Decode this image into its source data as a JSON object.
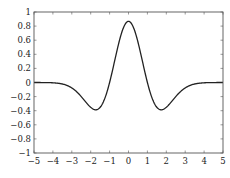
{
  "chart_data": {
    "type": "line",
    "title": "",
    "xlabel": "",
    "ylabel": "",
    "xlim": [
      -5,
      5
    ],
    "ylim": [
      -1,
      1
    ],
    "grid": false,
    "legend": null,
    "x_ticks": [
      -5,
      -4,
      -3,
      -2,
      -1,
      0,
      1,
      2,
      3,
      4,
      5
    ],
    "x_tick_labels": [
      "−5",
      "−4",
      "−3",
      "−2",
      "−1",
      "0",
      "1",
      "2",
      "3",
      "4",
      "5"
    ],
    "y_ticks": [
      -1,
      -0.8,
      -0.6,
      -0.4,
      -0.2,
      0,
      0.2,
      0.4,
      0.6,
      0.8,
      1
    ],
    "y_tick_labels": [
      "−1",
      "−0.8",
      "−0.6",
      "−0.4",
      "−0.2",
      "0",
      "0.2",
      "0.4",
      "0.6",
      "0.8",
      "1"
    ],
    "series": [
      {
        "name": "Mexican hat wavelet",
        "color": "#222222",
        "x": [
          -5,
          -4.5,
          -4,
          -3.5,
          -3,
          -2.5,
          -2,
          -1.73,
          -1.5,
          -1,
          -0.5,
          0,
          0.5,
          1,
          1.5,
          1.73,
          2,
          2.5,
          3,
          3.5,
          4,
          4.5,
          5
        ],
        "y": [
          0.0,
          -0.0005,
          -0.0044,
          -0.0247,
          -0.0915,
          -0.2157,
          -0.3516,
          -0.387,
          -0.3615,
          0.0,
          0.5741,
          0.8673,
          0.5741,
          0.0,
          -0.3615,
          -0.387,
          -0.3516,
          -0.2157,
          -0.0915,
          -0.0247,
          -0.0044,
          -0.0005,
          0.0
        ]
      }
    ],
    "annotations": []
  },
  "plot_area": {
    "left": 34,
    "top": 12,
    "right": 223,
    "bottom": 153
  },
  "colors": {
    "axis": "#555555",
    "line": "#222222",
    "background": "#ffffff"
  }
}
